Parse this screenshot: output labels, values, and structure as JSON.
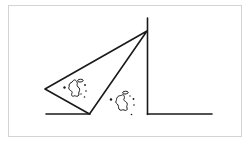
{
  "figure": {
    "width": 250,
    "height": 144,
    "background": "#ffffff",
    "frame": {
      "x": 8,
      "y": 5,
      "width": 234,
      "height": 132,
      "color": "#d4d4d4"
    },
    "stroke_color": "#1a1a1a",
    "elements": {
      "wall": {
        "x1": 147.5,
        "y1": 18,
        "x2": 147.5,
        "y2": 114.5
      },
      "floor_left": {
        "x1": 46,
        "y1": 114,
        "x2": 90,
        "y2": 114
      },
      "floor_right": {
        "x1": 147.5,
        "y1": 114,
        "x2": 212,
        "y2": 114
      },
      "triangle": {
        "apex": [
          147,
          31
        ],
        "left_vertex": [
          45,
          89
        ],
        "bottom_vertex": [
          89.5,
          114
        ]
      },
      "splatter_left": {
        "center": [
          74,
          87
        ],
        "dots": [
          [
            64,
            87
          ],
          [
            84,
            84
          ],
          [
            86,
            91
          ],
          [
            85,
            97
          ],
          [
            81,
            81
          ]
        ]
      },
      "splatter_right": {
        "center": [
          122,
          102
        ],
        "dots": [
          [
            111,
            99
          ],
          [
            133,
            99
          ],
          [
            134,
            105
          ],
          [
            131,
            115
          ],
          [
            127,
            93
          ]
        ]
      }
    }
  }
}
